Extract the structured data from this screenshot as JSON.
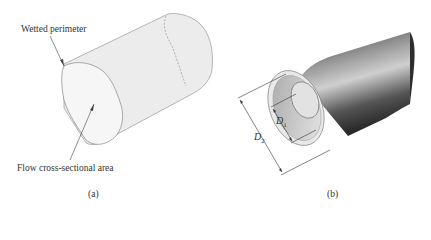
{
  "figure_a": {
    "label_wetted": "Wetted perimeter",
    "label_area": "Flow cross-sectional area",
    "caption": "(a)"
  },
  "figure_b": {
    "d1_symbol": "D",
    "d1_sub": "1",
    "d2_symbol": "D",
    "d2_sub": "2",
    "caption": "(b)"
  },
  "colors": {
    "irregular_fill": "#ececec",
    "irregular_face": "#f5f5f5",
    "pipe_dark": "#3a3a3a",
    "pipe_light": "#bdbdbd"
  }
}
